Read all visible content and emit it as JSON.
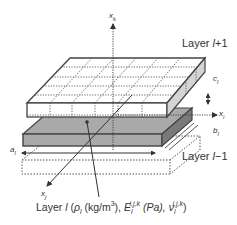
{
  "diagram": {
    "axes": {
      "vertical": "x",
      "vertical_sub": "k",
      "right": "x",
      "right_sub": "i",
      "diagonal": "x",
      "diagonal_sub": "j"
    },
    "layers": {
      "upper": {
        "prefix": "Layer ",
        "var": "l",
        "suffix": "+1"
      },
      "lower": {
        "prefix": "Layer ",
        "var": "l",
        "suffix": "−1"
      }
    },
    "dimensions": {
      "c": "c",
      "c_sub": "l",
      "b": "b",
      "b_sub": "l",
      "a": "a",
      "a_sub": "l"
    },
    "caption": {
      "prefix": "Layer ",
      "var": "l",
      "open": " (",
      "rho": "ρ",
      "rho_sub": "l",
      "rho_unit": " (kg/m",
      "rho_unit_sup": "3",
      "rho_unit_close": "), ",
      "E": "E",
      "E_sub": "l",
      "E_sup": "i,j,k",
      "E_unit": " (Pa), ",
      "nu": "ν",
      "nu_sub": "l",
      "nu_sup": "i,j,k",
      "close": ")"
    },
    "colors": {
      "outline": "#444444",
      "middle_top": "#a9a9a9",
      "middle_side": "#7a7a7a",
      "upper_side": "#d4d4d4",
      "text": "#333333"
    }
  }
}
